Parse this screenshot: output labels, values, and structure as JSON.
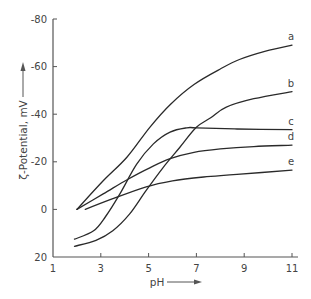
{
  "chart_data": {
    "type": "line",
    "title": "",
    "xlabel": "pH",
    "ylabel": "ζ-Potential, mV",
    "xlim": [
      1,
      11
    ],
    "ylim": [
      20,
      -80
    ],
    "y_axis_inverted": true,
    "grid": false,
    "legend": "inline labels at right end of curves",
    "x_ticks": [
      1,
      3,
      5,
      7,
      9,
      11
    ],
    "x_tick_labels": [
      "1",
      "3",
      "5",
      "7",
      "9",
      "11"
    ],
    "y_ticks": [
      -80,
      -60,
      -40,
      -20,
      0,
      20
    ],
    "y_tick_labels": [
      "-80",
      "-60",
      "-40",
      "-20",
      "0",
      "20"
    ],
    "series": [
      {
        "name": "a",
        "x": [
          2.0,
          3.1,
          4.1,
          5.05,
          5.9,
          6.9,
          8.0,
          8.8,
          9.9,
          11.0
        ],
        "y": [
          0,
          -12,
          -22,
          -34.5,
          -44,
          -52.5,
          -59,
          -63,
          -66.5,
          -69
        ]
      },
      {
        "name": "b",
        "x": [
          1.9,
          2.8,
          3.5,
          4.2,
          4.9,
          5.6,
          6.3,
          7.0,
          7.6,
          8.25,
          9.4,
          11.0
        ],
        "y": [
          15.5,
          13,
          9,
          2,
          -8,
          -17.5,
          -26,
          -34.5,
          -38.5,
          -43,
          -46.5,
          -49.5
        ]
      },
      {
        "name": "c",
        "x": [
          1.9,
          2.7,
          3.2,
          3.8,
          4.5,
          5.2,
          5.9,
          6.6,
          7.0,
          8.7,
          11.0
        ],
        "y": [
          12.5,
          9,
          3,
          -6.5,
          -19,
          -27.5,
          -32.5,
          -34.3,
          -34.3,
          -33.8,
          -33.5
        ]
      },
      {
        "name": "d",
        "x": [
          2.0,
          3.1,
          4.1,
          5.05,
          5.9,
          6.9,
          8.0,
          9.4,
          11.0
        ],
        "y": [
          0,
          -6.5,
          -12.5,
          -17.5,
          -21.3,
          -24,
          -25.4,
          -26.4,
          -27
        ]
      },
      {
        "name": "e",
        "x": [
          2.35,
          3.5,
          4.9,
          6.0,
          7.3,
          8.7,
          11.0
        ],
        "y": [
          0,
          -4.5,
          -9.5,
          -12,
          -13.6,
          -14.7,
          -16.5
        ]
      }
    ]
  },
  "axes": {
    "x_label": "pH",
    "y_label": "ζ-Potential, mV"
  },
  "style": {
    "line_color": "#2a2a2a",
    "axis_color": "#555555",
    "text_color": "#444444"
  }
}
